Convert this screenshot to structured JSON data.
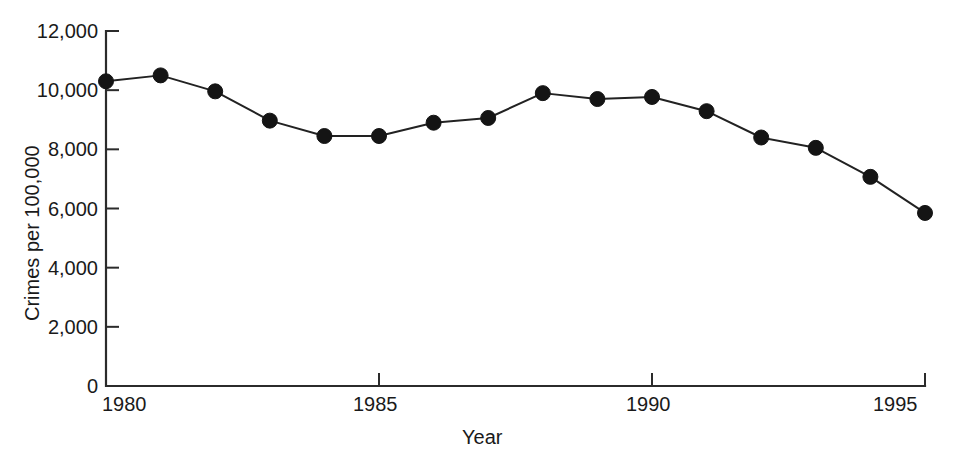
{
  "chart_data": {
    "type": "line",
    "title": "",
    "subtitle": "",
    "xlabel": "Year",
    "ylabel": "Crimes per 100,000",
    "xlim": [
      1980,
      1995
    ],
    "ylim": [
      0,
      12000
    ],
    "grid": false,
    "legend": null,
    "x": [
      1980,
      1981,
      1982,
      1983,
      1984,
      1985,
      1986,
      1987,
      1988,
      1989,
      1990,
      1991,
      1992,
      1993,
      1994,
      1995
    ],
    "values": [
      10300,
      10500,
      9960,
      8970,
      8450,
      8450,
      8900,
      9060,
      9900,
      9700,
      9770,
      9290,
      8400,
      8050,
      7070,
      5850
    ],
    "series": [
      {
        "name": "Crimes per 100,000",
        "values": [
          10300,
          10500,
          9960,
          8970,
          8450,
          8450,
          8900,
          9060,
          9900,
          9700,
          9770,
          9290,
          8400,
          8050,
          7070,
          5850
        ]
      }
    ],
    "y_ticks": [
      0,
      2000,
      4000,
      6000,
      8000,
      10000,
      12000
    ],
    "y_tick_labels": [
      "0",
      "2,000",
      "4,000",
      "6,000",
      "8,000",
      "10,000",
      "12,000"
    ],
    "x_ticks": [
      1980,
      1985,
      1990,
      1995
    ],
    "x_tick_labels": [
      "1980",
      "1985",
      "1990",
      "1995"
    ],
    "marker_color": "#141414",
    "line_color": "#222222",
    "axis_color": "#2b2b2b"
  },
  "axis": {
    "y_title": "Crimes per 100,000",
    "x_title": "Year"
  },
  "y_tick_labels": {
    "0": "0",
    "1": "2,000",
    "2": "4,000",
    "3": "6,000",
    "4": "8,000",
    "5": "10,000",
    "6": "12,000"
  },
  "x_tick_labels": {
    "0": "1980",
    "1": "1985",
    "2": "1990",
    "3": "1995"
  }
}
